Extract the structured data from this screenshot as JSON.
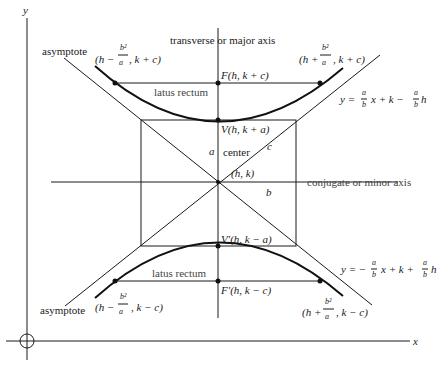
{
  "diagram": {
    "axes": {
      "x_label": "x",
      "y_label": "y"
    },
    "labels": {
      "transverse_axis": "transverse or major axis",
      "conjugate_axis": "conjugate or minor axis",
      "asymptote_upper": "asymptote",
      "asymptote_lower": "asymptote",
      "latus_rectum_upper": "latus rectum",
      "latus_rectum_lower": "latus rectum",
      "center": "center",
      "center_coords": "(h, k)",
      "a": "a",
      "b": "b",
      "c": "c"
    },
    "points": {
      "focus": "F(h, k + c)",
      "focus_prime": "F′(h, k − c)",
      "vertex": "V(h, k + a)",
      "vertex_prime": "V′(h, k − a)",
      "upper_left": {
        "pre": "(h −",
        "num": "b²",
        "den": "a",
        "post": ", k + c)"
      },
      "upper_right": {
        "pre": "(h +",
        "num": "b²",
        "den": "a",
        "post": ", k + c)"
      },
      "lower_left": {
        "pre": "(h −",
        "num": "b²",
        "den": "a",
        "post": ", k − c)"
      },
      "lower_right": {
        "pre": "(h +",
        "num": "b²",
        "den": "a",
        "post": ", k − c)"
      }
    },
    "equations": {
      "upper_asymptote": {
        "lhs": "y =",
        "f1num": "a",
        "f1den": "b",
        "mid": "x + k −",
        "f2num": "a",
        "f2den": "b",
        "tail": "h"
      },
      "lower_asymptote": {
        "lhs": "y = −",
        "f1num": "a",
        "f1den": "b",
        "mid": "x + k +",
        "f2num": "a",
        "f2den": "b",
        "tail": "h"
      }
    }
  }
}
